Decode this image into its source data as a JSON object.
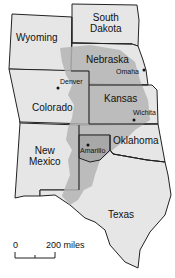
{
  "map": {
    "states": [
      {
        "name": "South Dakota",
        "line1": "South",
        "line2": "Dakota"
      },
      {
        "name": "Wyoming"
      },
      {
        "name": "Nebraska"
      },
      {
        "name": "Colorado"
      },
      {
        "name": "Kansas"
      },
      {
        "name": "New Mexico",
        "line1": "New",
        "line2": "Mexico"
      },
      {
        "name": "Oklahoma"
      },
      {
        "name": "Texas"
      }
    ],
    "cities": [
      {
        "name": "Denver"
      },
      {
        "name": "Omaha"
      },
      {
        "name": "Wichita"
      },
      {
        "name": "Amarillo"
      }
    ],
    "scale": {
      "start": "0",
      "end": "200 miles"
    },
    "colors": {
      "state_fill": "#e6e6e6",
      "aquifer_fill": "#b4b4b4",
      "highlight_fill": "#a8a8a8",
      "border": "#222222"
    }
  }
}
